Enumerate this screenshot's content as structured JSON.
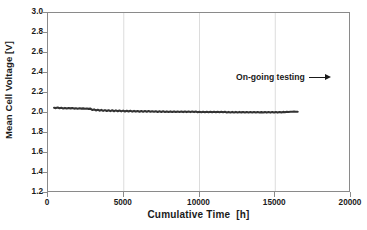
{
  "chart_data": {
    "type": "line",
    "title": "",
    "xlabel": "Cumulative Time  [h]",
    "ylabel": "Mean Cell Voltage  [V]",
    "xlim": [
      0,
      20000
    ],
    "ylim": [
      1.2,
      3.0
    ],
    "xticks": [
      0,
      5000,
      10000,
      15000,
      20000
    ],
    "xtick_labels": [
      "0",
      "5000",
      "10000",
      "15000",
      "20000"
    ],
    "yticks": [
      1.2,
      1.4,
      1.6,
      1.8,
      2.0,
      2.2,
      2.4,
      2.6,
      2.8,
      3.0
    ],
    "ytick_labels": [
      "1.2",
      "1.4",
      "1.6",
      "1.8",
      "2.0",
      "2.2",
      "2.4",
      "2.6",
      "2.8",
      "3.0"
    ],
    "grid": {
      "vertical": true,
      "horizontal": false
    },
    "legend": null,
    "line_color": "#333333",
    "annotations": [
      {
        "text": "On-going testing",
        "arrow": "right-arrow",
        "x": 14500,
        "y": 2.35
      }
    ],
    "series": [
      {
        "name": "Mean Cell Voltage",
        "x": [
          400,
          520,
          640,
          760,
          880,
          1000,
          1120,
          1240,
          1360,
          1480,
          1600,
          1720,
          1840,
          1960,
          2080,
          2200,
          2320,
          2440,
          2560,
          2680,
          2800,
          2920,
          3040,
          3160,
          3280,
          3400,
          3520,
          3640,
          3760,
          3880,
          4000,
          4120,
          4240,
          4360,
          4480,
          4600,
          4720,
          4840,
          4960,
          5080,
          5200,
          5320,
          5440,
          5560,
          5680,
          5800,
          5920,
          6040,
          6160,
          6280,
          6400,
          6520,
          6640,
          6760,
          6880,
          7000,
          7120,
          7240,
          7360,
          7480,
          7600,
          7720,
          7840,
          7960,
          8080,
          8200,
          8320,
          8440,
          8560,
          8680,
          8800,
          8920,
          9040,
          9160,
          9280,
          9400,
          9520,
          9640,
          9760,
          9880,
          10000,
          10120,
          10240,
          10360,
          10480,
          10600,
          10720,
          10840,
          10960,
          11080,
          11200,
          11320,
          11440,
          11560,
          11680,
          11800,
          11920,
          12040,
          12160,
          12280,
          12400,
          12520,
          12640,
          12760,
          12880,
          13000,
          13120,
          13240,
          13360,
          13480,
          13600,
          13720,
          13840,
          13960,
          14080,
          14200,
          14320,
          14440,
          14560,
          14680,
          14800,
          14920,
          15040,
          15160,
          15280,
          15400,
          15520,
          15640,
          15760,
          15880,
          16000,
          16120,
          16240,
          16360,
          16480
        ],
        "y": [
          2.053,
          2.049,
          2.054,
          2.047,
          2.052,
          2.046,
          2.051,
          2.045,
          2.05,
          2.046,
          2.049,
          2.044,
          2.048,
          2.043,
          2.047,
          2.044,
          2.046,
          2.042,
          2.045,
          2.041,
          2.044,
          2.03,
          2.036,
          2.026,
          2.033,
          2.023,
          2.031,
          2.021,
          2.029,
          2.02,
          2.028,
          2.019,
          2.027,
          2.018,
          2.026,
          2.017,
          2.025,
          2.016,
          2.024,
          2.015,
          2.023,
          2.015,
          2.022,
          2.014,
          2.021,
          2.014,
          2.02,
          2.013,
          2.02,
          2.013,
          2.019,
          2.012,
          2.019,
          2.012,
          2.018,
          2.012,
          2.018,
          2.011,
          2.017,
          2.011,
          2.017,
          2.011,
          2.016,
          2.01,
          2.016,
          2.01,
          2.016,
          2.01,
          2.015,
          2.01,
          2.015,
          2.009,
          2.015,
          2.009,
          2.014,
          2.009,
          2.014,
          2.009,
          2.014,
          2.008,
          2.013,
          2.008,
          2.013,
          2.008,
          2.013,
          2.008,
          2.013,
          2.007,
          2.012,
          2.007,
          2.012,
          2.007,
          2.012,
          2.007,
          2.012,
          2.006,
          2.011,
          2.006,
          2.011,
          2.006,
          2.011,
          2.006,
          2.011,
          2.006,
          2.01,
          2.005,
          2.01,
          2.005,
          2.01,
          2.005,
          2.01,
          2.005,
          2.01,
          2.005,
          2.009,
          2.005,
          2.009,
          2.004,
          2.009,
          2.004,
          2.009,
          2.004,
          2.009,
          2.004,
          2.01,
          2.006,
          2.011,
          2.008,
          2.012,
          2.01,
          2.013,
          2.012,
          2.014,
          2.013,
          2.013
        ]
      }
    ]
  }
}
